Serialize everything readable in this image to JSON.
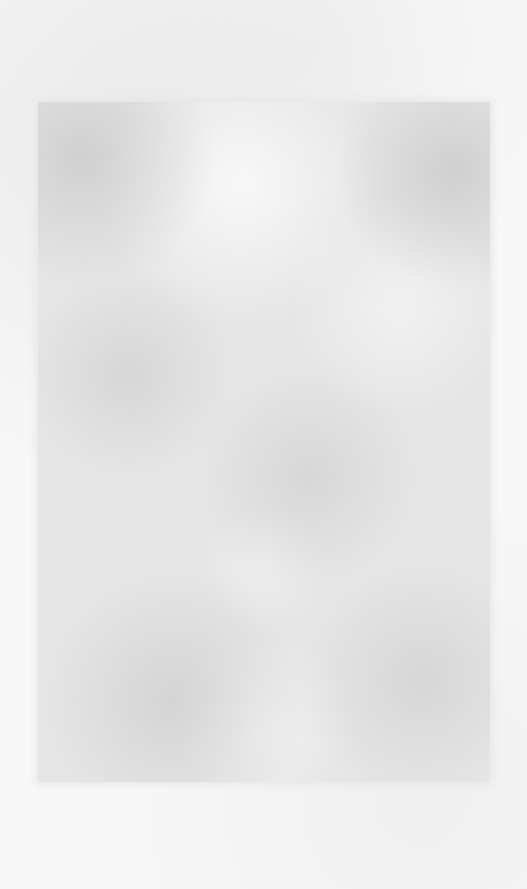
{
  "image": {
    "description": "Blank textured paper scan with a mottled gray rectangular region",
    "colors": {
      "background": "#f7f7f7",
      "panel": "#e6e6e6"
    },
    "text_content": []
  }
}
